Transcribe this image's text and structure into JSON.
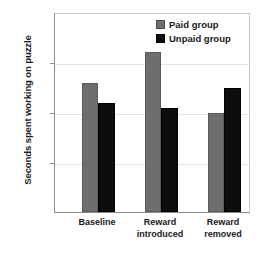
{
  "chart_data": {
    "type": "bar",
    "title": "",
    "xlabel": "",
    "ylabel": "Seconds spent working on puzzle",
    "categories": [
      "Baseline",
      "Reward introduced",
      "Reward removed"
    ],
    "category_lines": [
      [
        "Baseline"
      ],
      [
        "Reward",
        "introduced"
      ],
      [
        "Reward",
        "removed"
      ]
    ],
    "series": [
      {
        "name": "Paid group",
        "color": "#6e6e6e",
        "values": [
          258,
          320,
          199
        ]
      },
      {
        "name": "Unpaid group",
        "color": "#0d0d0d",
        "values": [
          218,
          208,
          248
        ]
      }
    ],
    "ylim": [
      0,
      400
    ],
    "yticks": [
      0,
      100,
      200,
      300,
      400
    ],
    "ytick_labels": [
      "0",
      "100",
      "200",
      "300",
      "400"
    ],
    "grid": true,
    "legend_position": "top-right",
    "legend_entries": [
      "Paid group",
      "Unpaid group"
    ]
  }
}
